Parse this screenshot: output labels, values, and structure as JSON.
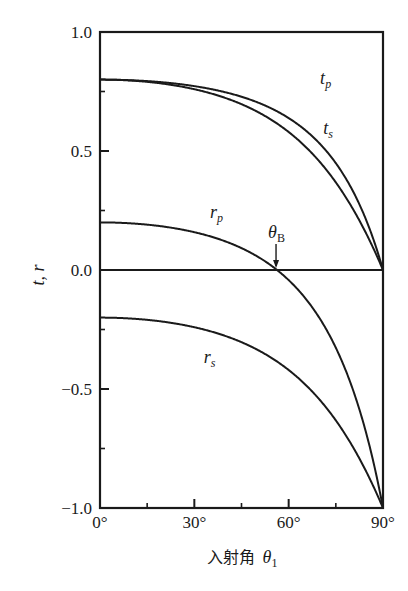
{
  "chart_data": {
    "type": "line",
    "title": "",
    "xlabel": "入射角 θ1",
    "xlabel_text": "入射角",
    "xlabel_symbol": "θ",
    "xlabel_subscript": "1",
    "ylabel": "t, r",
    "xlim": [
      0,
      90
    ],
    "ylim": [
      -1.0,
      1.0
    ],
    "grid": false,
    "legend": "none (inline curve labels)",
    "x_ticks": [
      0,
      30,
      60,
      90
    ],
    "x_tick_labels": [
      "0°",
      "30°",
      "60°",
      "90°"
    ],
    "x_minor_ticks": [
      15,
      45,
      75
    ],
    "y_ticks": [
      1.0,
      0.5,
      0.0,
      -0.5,
      -1.0
    ],
    "y_tick_labels": [
      "1.0",
      "0.5",
      "0.0",
      "−0.5",
      "−1.0"
    ],
    "y_minor_ticks": [
      0.75,
      0.25,
      -0.25,
      -0.75
    ],
    "horizontal_reference_line": 0.0,
    "x": [
      0,
      10,
      20,
      30,
      40,
      50,
      60,
      70,
      80,
      85,
      90
    ],
    "series": [
      {
        "name": "tp",
        "label_main": "t",
        "label_sub": "p",
        "values": [
          0.8,
          0.7973,
          0.7886,
          0.7726,
          0.7464,
          0.7048,
          0.6384,
          0.5292,
          0.3422,
          0.1985,
          0.0
        ]
      },
      {
        "name": "ts",
        "label_main": "t",
        "label_sub": "s",
        "values": [
          0.8,
          0.7959,
          0.783,
          0.7596,
          0.7222,
          0.6653,
          0.5798,
          0.4527,
          0.266,
          0.1442,
          0.0
        ]
      },
      {
        "name": "rp",
        "label_main": "r",
        "label_sub": "p",
        "values": [
          0.2,
          0.1959,
          0.1829,
          0.1589,
          0.1196,
          0.0572,
          -0.0424,
          -0.2061,
          -0.4868,
          -0.7023,
          -1.0
        ]
      },
      {
        "name": "rs",
        "label_main": "r",
        "label_sub": "s",
        "values": [
          -0.2,
          -0.2041,
          -0.217,
          -0.2404,
          -0.2778,
          -0.3347,
          -0.4202,
          -0.5473,
          -0.734,
          -0.8558,
          -1.0
        ]
      }
    ],
    "annotations": [
      {
        "text": "θB",
        "main": "θ",
        "sub": "B",
        "x": 56.3,
        "y": 0.0,
        "arrow": "down",
        "meaning": "Brewster angle"
      }
    ],
    "label_positions": {
      "tp": [
        70,
        0.78
      ],
      "ts": [
        71,
        0.57
      ],
      "rp": [
        35,
        0.22
      ],
      "rs": [
        33,
        -0.39
      ]
    }
  }
}
